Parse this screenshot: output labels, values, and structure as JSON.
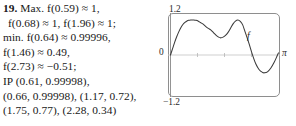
{
  "entry": {
    "number": "19.",
    "lines": [
      {
        "text": "Max. f(0.59) ≈ 1,",
        "indent": false
      },
      {
        "text": "f(0.68) ≈ 1, f(1.96) ≈ 1;",
        "indent": true
      },
      {
        "text": "min. f(0.64) ≈ 0.99996,",
        "indent": false
      },
      {
        "text": "f(1.46) ≈ 0.49,",
        "indent": false
      },
      {
        "text": "f(2.73) ≈ −0.51;",
        "indent": false
      },
      {
        "text": "IP (0.61, 0.99998),",
        "indent": false
      },
      {
        "text": "(0.66, 0.99998), (1.17, 0.72),",
        "indent": false
      },
      {
        "text": "(1.75, 0.77), (2.28, 0.34)",
        "indent": false
      }
    ]
  },
  "chart_data": {
    "type": "line",
    "title": "",
    "xlabel": "π",
    "ylabel": "",
    "curve_label": "f",
    "axis_origin_label": "0",
    "ytick_top_label": "1.2",
    "ytick_bottom_label": "−1.2",
    "xlim": [
      0,
      3.14159
    ],
    "ylim": [
      -1.2,
      1.2
    ],
    "grid": false,
    "legend": "none",
    "x_axis_tick_positions": [
      0.785,
      1.571,
      2.356
    ],
    "annotations": [
      {
        "label": "max",
        "x": 0.59,
        "y": 1.0
      },
      {
        "label": "max",
        "x": 0.68,
        "y": 1.0
      },
      {
        "label": "max",
        "x": 1.96,
        "y": 1.0
      },
      {
        "label": "min",
        "x": 0.64,
        "y": 0.99996
      },
      {
        "label": "min",
        "x": 1.46,
        "y": 0.49
      },
      {
        "label": "min",
        "x": 2.73,
        "y": -0.51
      },
      {
        "label": "IP",
        "x": 0.61,
        "y": 0.99998
      },
      {
        "label": "IP",
        "x": 0.66,
        "y": 0.99998
      },
      {
        "label": "IP",
        "x": 1.17,
        "y": 0.72
      },
      {
        "label": "IP",
        "x": 1.75,
        "y": 0.77
      },
      {
        "label": "IP",
        "x": 2.28,
        "y": 0.34
      }
    ],
    "points": [
      [
        0.0,
        0.0
      ],
      [
        0.06,
        0.18
      ],
      [
        0.12,
        0.36
      ],
      [
        0.18,
        0.52
      ],
      [
        0.24,
        0.66
      ],
      [
        0.3,
        0.78
      ],
      [
        0.36,
        0.87
      ],
      [
        0.42,
        0.93
      ],
      [
        0.48,
        0.97
      ],
      [
        0.53,
        0.99
      ],
      [
        0.59,
        1.0
      ],
      [
        0.64,
        0.99996
      ],
      [
        0.68,
        1.0
      ],
      [
        0.74,
        0.99
      ],
      [
        0.8,
        0.97
      ],
      [
        0.87,
        0.93
      ],
      [
        0.95,
        0.88
      ],
      [
        1.02,
        0.82
      ],
      [
        1.1,
        0.76
      ],
      [
        1.17,
        0.72
      ],
      [
        1.25,
        0.64
      ],
      [
        1.33,
        0.56
      ],
      [
        1.4,
        0.51
      ],
      [
        1.46,
        0.49
      ],
      [
        1.53,
        0.51
      ],
      [
        1.6,
        0.56
      ],
      [
        1.67,
        0.64
      ],
      [
        1.75,
        0.77
      ],
      [
        1.82,
        0.89
      ],
      [
        1.89,
        0.97
      ],
      [
        1.96,
        1.0
      ],
      [
        2.03,
        0.96
      ],
      [
        2.1,
        0.86
      ],
      [
        2.17,
        0.66
      ],
      [
        2.28,
        0.34
      ],
      [
        2.38,
        0.02
      ],
      [
        2.48,
        -0.25
      ],
      [
        2.58,
        -0.42
      ],
      [
        2.68,
        -0.5
      ],
      [
        2.73,
        -0.51
      ],
      [
        2.82,
        -0.48
      ],
      [
        2.92,
        -0.37
      ],
      [
        3.02,
        -0.2
      ],
      [
        3.1,
        -0.03
      ],
      [
        3.14,
        0.06
      ]
    ]
  }
}
